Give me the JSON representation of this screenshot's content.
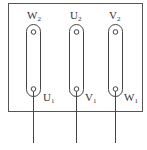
{
  "diagram": {
    "type": "motor-terminal-box",
    "stroke_color": "#444444",
    "top_labels": [
      {
        "main": "W",
        "sub": "2"
      },
      {
        "main": "U",
        "sub": "2"
      },
      {
        "main": "V",
        "sub": "2"
      }
    ],
    "bottom_labels": [
      {
        "main": "U",
        "sub": "1"
      },
      {
        "main": "V",
        "sub": "1"
      },
      {
        "main": "W",
        "sub": "1"
      }
    ]
  }
}
